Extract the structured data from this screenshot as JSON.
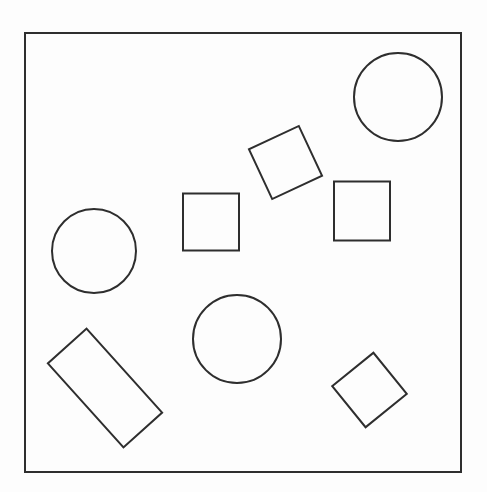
{
  "canvas": {
    "width": 487,
    "height": 492,
    "background_color": "#fdfdfd",
    "stroke_color": "#2e2e2e",
    "fill_color": "none",
    "stroke_width": 2,
    "title": "geometric-shapes-line-drawing",
    "description": "Plain line drawing: a rectangular frame containing ten unfilled outline shapes - three circles, three axis-aligned-or-rotated squares, one rotated square diamond, one rotated rectangle"
  },
  "frame": {
    "name": "outer-border-rectangle",
    "x": 25,
    "y": 33,
    "width": 436,
    "height": 439,
    "stroke_width": 2
  },
  "shapes": [
    {
      "id": "circle-top-right",
      "label": "Circle",
      "type": "circle",
      "cx": 398,
      "cy": 97,
      "r": 44,
      "rotation": 0
    },
    {
      "id": "circle-left",
      "label": "Circle",
      "type": "circle",
      "cx": 94,
      "cy": 251,
      "r": 42,
      "rotation": 0
    },
    {
      "id": "circle-center-bottom",
      "label": "Circle",
      "type": "circle",
      "cx": 237,
      "cy": 339,
      "r": 44,
      "rotation": 0
    },
    {
      "id": "square-center",
      "label": "Square",
      "type": "rect",
      "cx": 211,
      "cy": 222,
      "width": 56,
      "height": 57,
      "rotation": 0
    },
    {
      "id": "square-right",
      "label": "Square",
      "type": "rect",
      "cx": 362,
      "cy": 211,
      "width": 56,
      "height": 59,
      "rotation": 0
    },
    {
      "id": "square-rotated-top",
      "label": "Rotated square",
      "type": "rect",
      "cx": 285.5,
      "cy": 162.5,
      "width": 55,
      "height": 55,
      "rotation": -25
    },
    {
      "id": "square-rotated-bottom-right",
      "label": "Rotated square",
      "type": "rect",
      "cx": 369.5,
      "cy": 390,
      "width": 53,
      "height": 53,
      "rotation": -39
    },
    {
      "id": "rectangle-rotated-bottom-left",
      "label": "Rotated rectangle",
      "type": "rect",
      "cx": 105,
      "cy": 388,
      "width": 113,
      "height": 52,
      "rotation": 48
    }
  ]
}
